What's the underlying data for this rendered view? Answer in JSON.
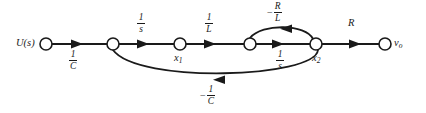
{
  "figure": {
    "type": "signal-flow-graph",
    "title": "",
    "width": 426,
    "height": 113,
    "background": "#ffffff",
    "stroke_color": "#1a1a1a"
  },
  "nodes": [
    {
      "id": "u",
      "label": "U(s)",
      "sub": "",
      "label_side": "left",
      "x": 46,
      "y": 44,
      "r": 6
    },
    {
      "id": "n2",
      "label": "",
      "sub": "",
      "label_side": "none",
      "x": 113,
      "y": 44,
      "r": 6
    },
    {
      "id": "x1",
      "label": "x",
      "sub": "1",
      "label_side": "below",
      "x": 180,
      "y": 44,
      "r": 6
    },
    {
      "id": "n4",
      "label": "",
      "sub": "",
      "label_side": "none",
      "x": 250,
      "y": 44,
      "r": 6
    },
    {
      "id": "x2",
      "label": "x",
      "sub": "2",
      "label_side": "below",
      "x": 316,
      "y": 44,
      "r": 6
    },
    {
      "id": "vo",
      "label": "v",
      "sub": "o",
      "label_side": "right",
      "x": 385,
      "y": 44,
      "r": 6
    }
  ],
  "edges": [
    {
      "id": "e1",
      "from": "u",
      "to": "n2",
      "gain_minus": "",
      "gain_num": "1",
      "gain_den": "C",
      "gain_text": "1/C",
      "position": "below",
      "shape": "straight"
    },
    {
      "id": "e2",
      "from": "n2",
      "to": "x1",
      "gain_minus": "",
      "gain_num": "1",
      "gain_den": "s",
      "gain_text": "1/s",
      "position": "above",
      "shape": "straight"
    },
    {
      "id": "e3",
      "from": "x1",
      "to": "n4",
      "gain_minus": "",
      "gain_num": "1",
      "gain_den": "L",
      "gain_text": "1/L",
      "position": "above",
      "shape": "straight"
    },
    {
      "id": "e4",
      "from": "n4",
      "to": "x2",
      "gain_minus": "",
      "gain_num": "1",
      "gain_den": "s",
      "gain_text": "1/s",
      "position": "below",
      "shape": "straight"
    },
    {
      "id": "e5",
      "from": "x2",
      "to": "n4",
      "gain_minus": "−",
      "gain_num": "R",
      "gain_den": "L",
      "gain_text": "-R/L",
      "position": "above",
      "shape": "arc-up"
    },
    {
      "id": "e6",
      "from": "x2",
      "to": "n2",
      "gain_minus": "−",
      "gain_num": "1",
      "gain_den": "C",
      "gain_text": "-1/C",
      "position": "below",
      "shape": "arc-down"
    }
  ],
  "edge_gain_simple": [
    {
      "id": "e7",
      "from": "x2",
      "to": "vo",
      "gain_text": "R",
      "position": "above"
    }
  ],
  "labels": {
    "input": "U(s)",
    "output_base": "v",
    "output_sub": "o",
    "state1_base": "x",
    "state1_sub": "1",
    "state2_base": "x",
    "state2_sub": "2",
    "gain_R": "R",
    "gain_1_over_C_num": "1",
    "gain_1_over_C_den": "C",
    "gain_1_over_s_num": "1",
    "gain_1_over_s_den": "s",
    "gain_1_over_L_num": "1",
    "gain_1_over_L_den": "L",
    "gain_neg_R_over_L_minus": "−",
    "gain_neg_R_over_L_num": "R",
    "gain_neg_R_over_L_den": "L",
    "gain_neg_1_over_C_minus": "−",
    "gain_neg_1_over_C_num": "1",
    "gain_neg_1_over_C_den": "C",
    "gain_neg_R_over_L_2_num": "1",
    "gain_neg_R_over_L_2_den": "s"
  }
}
